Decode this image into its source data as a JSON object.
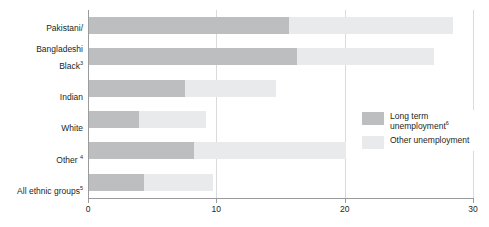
{
  "chart_data": {
    "type": "bar",
    "orientation": "horizontal",
    "stacked": true,
    "title": "",
    "subtitle": "",
    "xlabel": "",
    "ylabel": "",
    "xlim": [
      0,
      30
    ],
    "xticks": [
      0,
      10,
      20,
      30
    ],
    "xtick_labels": [
      "0",
      "10",
      "20",
      "30"
    ],
    "grid": "vertical",
    "categories": [
      "Pakistani/\nBangladeshi",
      "Black",
      "Indian",
      "White",
      "Other",
      "All ethnic groups"
    ],
    "category_footnotes": [
      "",
      "3",
      "",
      "",
      "4",
      "5"
    ],
    "series": [
      {
        "name": "Long term unemployment",
        "footnote": "6",
        "color": "#bdbec0",
        "values": [
          15.6,
          16.2,
          7.5,
          3.9,
          8.2,
          4.3
        ]
      },
      {
        "name": "Other unemployment",
        "footnote": "",
        "color": "#e9eaeb",
        "values": [
          12.8,
          10.7,
          7.1,
          5.2,
          11.8,
          5.4
        ]
      }
    ],
    "totals": [
      28.4,
      26.9,
      14.6,
      9.1,
      20.0,
      9.7
    ],
    "legend": {
      "position": "inside-right",
      "entries": [
        {
          "label": "Long term\nunemployment",
          "footnote": "6",
          "swatch": "long"
        },
        {
          "label": "Other unemployment",
          "footnote": "",
          "swatch": "other"
        }
      ]
    }
  },
  "axis": {
    "tick_0": "0",
    "tick_1": "10",
    "tick_2": "20",
    "tick_3": "30"
  },
  "labels": {
    "cat_0_line_1": "Pakistani/",
    "cat_0_line_2": "Bangladeshi",
    "cat_1": "Black",
    "cat_1_sup": "3",
    "cat_2": "Indian",
    "cat_3": "White",
    "cat_4": "Other ",
    "cat_4_sup": "4",
    "cat_5": "All ethnic groups",
    "cat_5_sup": "5"
  },
  "legend_text": {
    "item_0_line_1": "Long term",
    "item_0_line_2": "unemployment",
    "item_0_sup": "6",
    "item_1": "Other unemployment"
  },
  "colors": {
    "long_term": "#bdbec0",
    "other": "#e9eaeb",
    "axis": "#9a9b9d",
    "grid": "#d9dadb",
    "text": "#231f20",
    "background": "#ffffff"
  }
}
